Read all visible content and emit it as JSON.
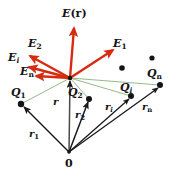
{
  "figure": {
    "background_color": "#ffffff",
    "width": 180,
    "height": 179,
    "colors": {
      "field_vector": "#d62b11",
      "position_vector": "#1a1a1a",
      "separation_line": "#7aa86a",
      "charge_dot": "#141414",
      "label": "#111111"
    },
    "origin": {
      "label": "0",
      "x": 69,
      "y": 152
    },
    "field_point": {
      "x": 70,
      "y": 78
    },
    "field_vectors": [
      {
        "name": "E(r)",
        "base": "E",
        "sub": "",
        "paren": "(r)",
        "label_x": 62,
        "label_y": 10,
        "tip_x": 74,
        "tip_y": 27
      },
      {
        "name": "E_1",
        "base": "E",
        "sub": "1",
        "paren": "",
        "label_x": 113,
        "label_y": 40,
        "tip_x": 112,
        "tip_y": 49
      },
      {
        "name": "E_2",
        "base": "E",
        "sub": "2",
        "paren": "",
        "label_x": 28,
        "label_y": 40,
        "tip_x": 28,
        "tip_y": 55
      },
      {
        "name": "E_i",
        "base": "E",
        "sub": "i",
        "paren": "",
        "label_x": 12,
        "label_y": 54,
        "tip_x": 27,
        "tip_y": 66
      },
      {
        "name": "E_n",
        "base": "E",
        "sub": "n",
        "paren": "",
        "label_x": 22,
        "label_y": 69,
        "tip_x": 34,
        "tip_y": 76
      }
    ],
    "charges": [
      {
        "name": "Q_1",
        "base": "Q",
        "sub": "1",
        "labeled": true,
        "x": 21,
        "y": 104,
        "label_x": 13,
        "label_y": 89
      },
      {
        "name": "Q_2",
        "base": "Q",
        "sub": "2",
        "labeled": true,
        "x": 89,
        "y": 99,
        "label_x": 70,
        "label_y": 89
      },
      {
        "name": "Q_i",
        "base": "Q",
        "sub": "i",
        "labeled": true,
        "x": 131,
        "y": 96,
        "label_x": 122,
        "label_y": 84
      },
      {
        "name": "Q_n",
        "base": "Q",
        "sub": "n",
        "labeled": true,
        "x": 160,
        "y": 85,
        "label_x": 148,
        "label_y": 70
      },
      {
        "name": "charge-dot-unlabeled-1",
        "labeled": false,
        "x": 122,
        "y": 68
      },
      {
        "name": "charge-dot-unlabeled-2",
        "labeled": false,
        "x": 152,
        "y": 58
      }
    ],
    "position_vectors": [
      {
        "name": "r",
        "base": "r",
        "sub": "",
        "label_x": 54,
        "label_y": 99,
        "to_x": 70,
        "to_y": 80
      },
      {
        "name": "r_1",
        "base": "r",
        "sub": "1",
        "label_x": 31,
        "label_y": 131,
        "to_x": 23,
        "to_y": 106
      },
      {
        "name": "r_2",
        "base": "r",
        "sub": "2",
        "label_x": 77,
        "label_y": 112,
        "to_x": 88,
        "to_y": 101
      },
      {
        "name": "r_i",
        "base": "r",
        "sub": "i",
        "label_x": 106,
        "label_y": 104,
        "to_x": 130,
        "to_y": 98
      },
      {
        "name": "r_n",
        "base": "r",
        "sub": "n",
        "label_x": 143,
        "label_y": 104,
        "to_x": 159,
        "to_y": 87
      }
    ],
    "separation_lines": [
      {
        "name": "line-to-Q1",
        "to_x": 21,
        "to_y": 104
      },
      {
        "name": "line-to-Q2",
        "to_x": 89,
        "to_y": 99
      },
      {
        "name": "line-to-Qi",
        "to_x": 131,
        "to_y": 96
      },
      {
        "name": "line-to-Qn",
        "to_x": 160,
        "to_y": 85
      }
    ]
  }
}
